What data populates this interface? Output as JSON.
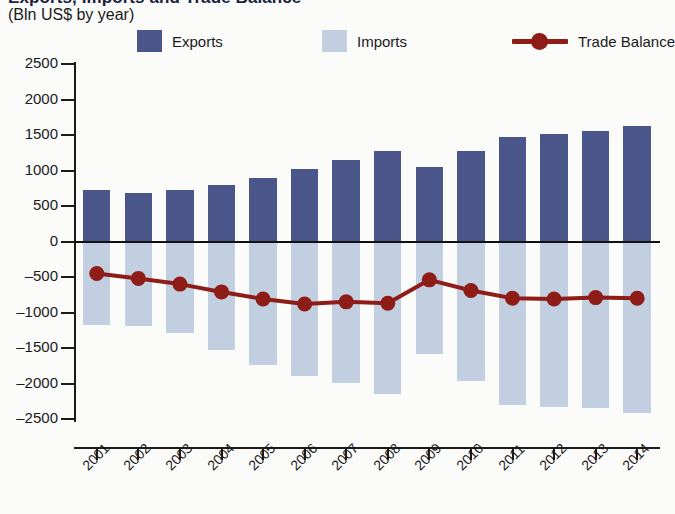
{
  "title": {
    "main": "Exports, Imports and Trade Balance",
    "sub": "(Bln US$ by year)"
  },
  "legend": {
    "position": "top",
    "items": [
      {
        "label": "Exports",
        "type": "bar",
        "color": "#4a5689",
        "icon": "square-swatch"
      },
      {
        "label": "Imports",
        "type": "bar",
        "color": "#c2cfe0",
        "icon": "square-swatch"
      },
      {
        "label": "Trade Balance",
        "type": "line",
        "color": "#8e1c17",
        "icon": "line-marker"
      }
    ]
  },
  "chart_data": {
    "type": "bar",
    "title": "Exports, Imports and Trade Balance",
    "subtitle": "(Bln US$ by year)",
    "xlabel": "",
    "ylabel": "Bln US$",
    "ylim": [
      -2500,
      2500
    ],
    "yticks": [
      2500,
      2000,
      1500,
      1000,
      500,
      0,
      -500,
      -1000,
      -1500,
      -2000,
      -2500
    ],
    "ytick_labels": [
      "2500",
      "2000",
      "1500",
      "1000",
      "500",
      "0",
      "-500",
      "-1000",
      "-1500",
      "-2000",
      "-2500"
    ],
    "grid": false,
    "legend_position": "top",
    "categories": [
      "2001",
      "2002",
      "2003",
      "2004",
      "2005",
      "2006",
      "2007",
      "2008",
      "2009",
      "2010",
      "2011",
      "2012",
      "2013",
      "2014"
    ],
    "series": [
      {
        "name": "Exports",
        "type": "bar",
        "color": "#4a5689",
        "values": [
          730,
          690,
          720,
          800,
          900,
          1020,
          1150,
          1280,
          1050,
          1270,
          1470,
          1520,
          1560,
          1620
        ]
      },
      {
        "name": "Imports",
        "type": "bar",
        "color": "#c2cfe0",
        "values": [
          -1170,
          -1190,
          -1290,
          -1530,
          -1740,
          -1900,
          -1990,
          -2150,
          -1590,
          -1960,
          -2300,
          -2330,
          -2340,
          -2420
        ]
      },
      {
        "name": "Trade Balance",
        "type": "line",
        "color": "#8e1c17",
        "marker": "circle",
        "values": [
          -450,
          -520,
          -600,
          -710,
          -810,
          -880,
          -850,
          -870,
          -540,
          -690,
          -800,
          -810,
          -790,
          -800
        ]
      }
    ]
  }
}
